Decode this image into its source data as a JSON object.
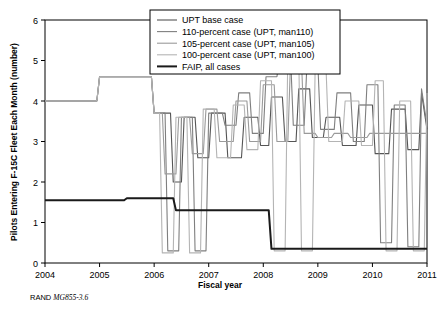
{
  "chart_data": {
    "type": "line",
    "title": "",
    "xlabel": "Fiscal year",
    "ylabel": "Pilots Entering F-15C Fleet Each Month (number)",
    "xlim": [
      2004,
      2011
    ],
    "ylim": [
      0,
      6
    ],
    "xticks": [
      "2004",
      "2005",
      "2006",
      "2007",
      "2008",
      "2009",
      "2010",
      "2011"
    ],
    "yticks": [
      "0",
      "1",
      "2",
      "3",
      "4",
      "5",
      "6"
    ],
    "grid": false,
    "legend_position": "top-center",
    "series": [
      {
        "name": "UPT base case",
        "color": "#555555",
        "width": 1.1,
        "points": [
          [
            2004.0,
            4.0
          ],
          [
            2004.95,
            4.0
          ],
          [
            2005.0,
            4.6
          ],
          [
            2005.95,
            4.6
          ],
          [
            2006.0,
            3.7
          ],
          [
            2006.3,
            3.7
          ],
          [
            2006.35,
            2.0
          ],
          [
            2006.5,
            2.0
          ],
          [
            2006.55,
            3.6
          ],
          [
            2006.75,
            3.6
          ],
          [
            2006.8,
            2.6
          ],
          [
            2007.0,
            2.6
          ],
          [
            2007.05,
            3.7
          ],
          [
            2007.3,
            3.7
          ],
          [
            2007.35,
            2.6
          ],
          [
            2007.6,
            2.6
          ],
          [
            2007.65,
            3.6
          ],
          [
            2007.9,
            3.6
          ],
          [
            2007.95,
            2.9
          ],
          [
            2008.1,
            2.9
          ],
          [
            2008.15,
            4.1
          ],
          [
            2008.35,
            4.1
          ],
          [
            2008.4,
            3.0
          ],
          [
            2008.6,
            3.0
          ],
          [
            2008.65,
            4.3
          ],
          [
            2008.85,
            4.3
          ],
          [
            2008.9,
            3.1
          ],
          [
            2009.1,
            3.1
          ],
          [
            2009.15,
            3.6
          ],
          [
            2009.4,
            3.6
          ],
          [
            2009.45,
            2.9
          ],
          [
            2009.7,
            2.9
          ],
          [
            2009.75,
            3.9
          ],
          [
            2010.0,
            3.9
          ],
          [
            2010.05,
            2.7
          ],
          [
            2010.3,
            2.7
          ],
          [
            2010.35,
            3.8
          ],
          [
            2010.6,
            3.8
          ],
          [
            2010.65,
            2.8
          ],
          [
            2010.85,
            2.8
          ],
          [
            2010.9,
            4.2
          ],
          [
            2011.0,
            3.3
          ]
        ]
      },
      {
        "name": "110-percent case (UPT, man110)",
        "color": "#7f7f7f",
        "width": 1.1,
        "points": [
          [
            2004.0,
            4.0
          ],
          [
            2004.95,
            4.0
          ],
          [
            2005.0,
            4.6
          ],
          [
            2005.95,
            4.6
          ],
          [
            2006.0,
            3.7
          ],
          [
            2006.2,
            3.7
          ],
          [
            2006.25,
            0.3
          ],
          [
            2006.45,
            0.3
          ],
          [
            2006.5,
            3.6
          ],
          [
            2006.7,
            3.6
          ],
          [
            2006.75,
            0.3
          ],
          [
            2006.95,
            0.3
          ],
          [
            2007.0,
            3.7
          ],
          [
            2007.25,
            3.7
          ],
          [
            2007.3,
            3.4
          ],
          [
            2007.5,
            3.4
          ],
          [
            2007.55,
            4.2
          ],
          [
            2007.75,
            4.2
          ],
          [
            2007.8,
            3.2
          ],
          [
            2008.0,
            3.2
          ],
          [
            2008.05,
            4.6
          ],
          [
            2008.25,
            4.6
          ],
          [
            2008.3,
            5.1
          ],
          [
            2008.5,
            5.1
          ],
          [
            2008.55,
            3.4
          ],
          [
            2008.75,
            3.4
          ],
          [
            2008.8,
            4.9
          ],
          [
            2009.0,
            4.9
          ],
          [
            2009.05,
            3.3
          ],
          [
            2009.3,
            3.3
          ],
          [
            2009.35,
            4.2
          ],
          [
            2009.6,
            4.2
          ],
          [
            2009.65,
            3.0
          ],
          [
            2009.85,
            3.0
          ],
          [
            2009.9,
            4.4
          ],
          [
            2010.1,
            4.4
          ],
          [
            2010.15,
            0.5
          ],
          [
            2010.35,
            0.5
          ],
          [
            2010.4,
            3.9
          ],
          [
            2010.6,
            3.9
          ],
          [
            2010.65,
            0.4
          ],
          [
            2010.85,
            0.4
          ],
          [
            2010.9,
            4.3
          ],
          [
            2011.0,
            3.4
          ]
        ]
      },
      {
        "name": "105-percent case (UPT, man105)",
        "color": "#9a9a9a",
        "width": 1.1,
        "points": [
          [
            2004.0,
            4.0
          ],
          [
            2004.95,
            4.0
          ],
          [
            2005.0,
            4.6
          ],
          [
            2005.95,
            4.6
          ],
          [
            2006.0,
            3.7
          ],
          [
            2006.15,
            3.7
          ],
          [
            2006.2,
            2.2
          ],
          [
            2006.4,
            2.2
          ],
          [
            2006.45,
            3.6
          ],
          [
            2006.65,
            3.6
          ],
          [
            2006.7,
            2.7
          ],
          [
            2006.9,
            2.7
          ],
          [
            2006.95,
            3.8
          ],
          [
            2007.15,
            3.8
          ],
          [
            2007.2,
            3.0
          ],
          [
            2007.45,
            3.0
          ],
          [
            2007.5,
            4.0
          ],
          [
            2007.7,
            4.0
          ],
          [
            2007.75,
            3.0
          ],
          [
            2007.95,
            3.0
          ],
          [
            2008.0,
            4.4
          ],
          [
            2008.2,
            4.4
          ],
          [
            2008.25,
            3.0
          ],
          [
            2008.45,
            3.0
          ],
          [
            2008.5,
            5.0
          ],
          [
            2008.7,
            5.0
          ],
          [
            2008.75,
            3.2
          ],
          [
            2008.95,
            3.2
          ],
          [
            2009.0,
            3.1
          ],
          [
            2009.25,
            3.1
          ],
          [
            2009.3,
            3.2
          ],
          [
            2009.55,
            3.2
          ],
          [
            2009.6,
            3.1
          ],
          [
            2009.9,
            3.1
          ],
          [
            2009.95,
            3.2
          ],
          [
            2010.2,
            3.2
          ],
          [
            2010.25,
            3.2
          ],
          [
            2010.5,
            3.2
          ],
          [
            2010.55,
            3.2
          ],
          [
            2010.8,
            3.2
          ],
          [
            2010.85,
            3.2
          ],
          [
            2011.0,
            3.2
          ]
        ]
      },
      {
        "name": "100-percent case (UPT, man100)",
        "color": "#b4b4b4",
        "width": 1.1,
        "points": [
          [
            2004.0,
            4.0
          ],
          [
            2004.95,
            4.0
          ],
          [
            2005.0,
            4.6
          ],
          [
            2005.95,
            4.6
          ],
          [
            2006.0,
            3.7
          ],
          [
            2006.1,
            3.7
          ],
          [
            2006.15,
            0.25
          ],
          [
            2006.35,
            0.25
          ],
          [
            2006.4,
            3.6
          ],
          [
            2006.6,
            3.6
          ],
          [
            2006.65,
            0.25
          ],
          [
            2006.85,
            0.25
          ],
          [
            2006.9,
            3.8
          ],
          [
            2007.1,
            3.8
          ],
          [
            2007.15,
            2.6
          ],
          [
            2007.4,
            2.6
          ],
          [
            2007.45,
            3.9
          ],
          [
            2007.65,
            3.9
          ],
          [
            2007.7,
            2.8
          ],
          [
            2007.9,
            2.8
          ],
          [
            2007.95,
            4.5
          ],
          [
            2008.15,
            4.5
          ],
          [
            2008.2,
            0.3
          ],
          [
            2008.4,
            0.3
          ],
          [
            2008.45,
            5.2
          ],
          [
            2008.65,
            5.2
          ],
          [
            2008.7,
            0.3
          ],
          [
            2008.9,
            0.3
          ],
          [
            2008.95,
            4.8
          ],
          [
            2009.15,
            4.8
          ],
          [
            2009.2,
            3.0
          ],
          [
            2009.45,
            3.0
          ],
          [
            2009.5,
            4.0
          ],
          [
            2009.75,
            4.0
          ],
          [
            2009.8,
            2.9
          ],
          [
            2010.0,
            2.9
          ],
          [
            2010.05,
            4.5
          ],
          [
            2010.2,
            4.5
          ],
          [
            2010.25,
            0.3
          ],
          [
            2010.45,
            0.3
          ],
          [
            2010.5,
            4.0
          ],
          [
            2010.7,
            4.0
          ],
          [
            2010.75,
            0.3
          ],
          [
            2010.95,
            0.3
          ],
          [
            2011.0,
            4.2
          ]
        ]
      },
      {
        "name": "FAIP, all cases",
        "color": "#1a1a1a",
        "width": 2.0,
        "points": [
          [
            2004.0,
            1.55
          ],
          [
            2005.45,
            1.55
          ],
          [
            2005.5,
            1.6
          ],
          [
            2006.35,
            1.6
          ],
          [
            2006.4,
            1.3
          ],
          [
            2008.1,
            1.3
          ],
          [
            2008.15,
            0.35
          ],
          [
            2011.0,
            0.35
          ]
        ]
      }
    ]
  },
  "source_note": {
    "prefix": "RAND ",
    "italic": "MG855-3.6"
  }
}
